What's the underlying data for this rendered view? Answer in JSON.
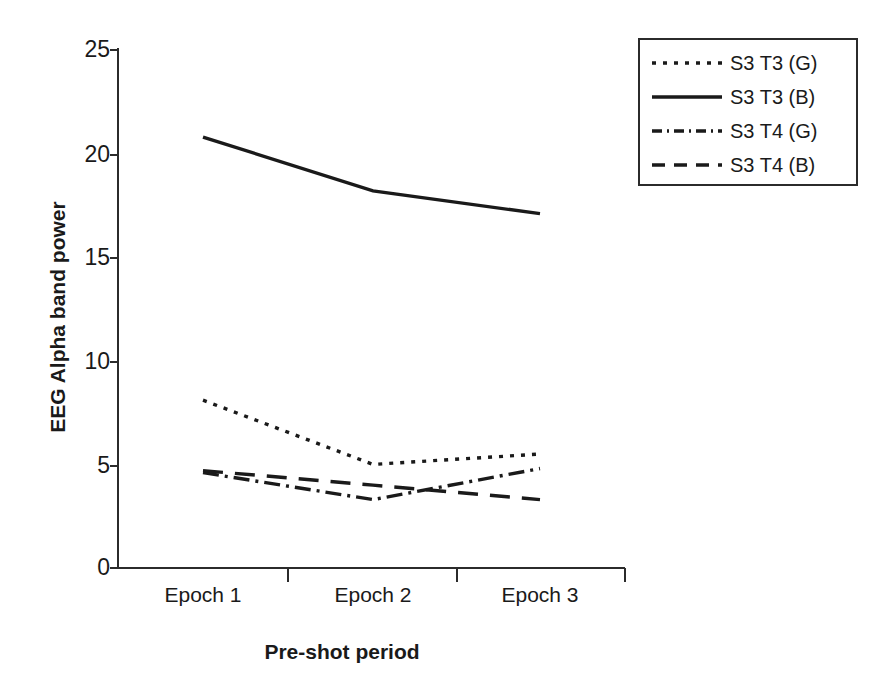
{
  "chart_data": {
    "type": "line",
    "title": "",
    "xlabel": "Pre-shot period",
    "ylabel": "EEG Alpha band power",
    "categories": [
      "Epoch 1",
      "Epoch 2",
      "Epoch 3"
    ],
    "ylim": [
      0,
      25
    ],
    "yticks": [
      0,
      5,
      10,
      15,
      20,
      25
    ],
    "ytick_labels": [
      "0",
      "5",
      "10",
      "15",
      "20",
      "25"
    ],
    "grid": false,
    "legend_position": "top-right",
    "series": [
      {
        "name": "S3 T3 (G)",
        "style": "dotted",
        "color": "#1a1a1a",
        "values": [
          8.1,
          5.0,
          5.5
        ]
      },
      {
        "name": "S3 T3 (B)",
        "style": "solid",
        "color": "#1a1a1a",
        "values": [
          20.8,
          18.2,
          17.1
        ]
      },
      {
        "name": "S3 T4 (G)",
        "style": "dashdot",
        "color": "#1a1a1a",
        "values": [
          4.6,
          3.3,
          4.8
        ]
      },
      {
        "name": "S3 T4 (B)",
        "style": "dashed",
        "color": "#1a1a1a",
        "values": [
          4.7,
          4.0,
          3.3
        ]
      }
    ]
  },
  "axis": {
    "y_title": "EEG Alpha band power",
    "x_title": "Pre-shot period",
    "y_labels": [
      "25",
      "20",
      "15",
      "10",
      "5",
      "0"
    ],
    "x_labels": [
      "Epoch 1",
      "Epoch 2",
      "Epoch 3"
    ]
  },
  "legend": {
    "entries": [
      {
        "label": "S3 T3 (G)"
      },
      {
        "label": "S3 T3 (B)"
      },
      {
        "label": "S3 T4 (G)"
      },
      {
        "label": "S3 T4 (B)"
      }
    ]
  }
}
